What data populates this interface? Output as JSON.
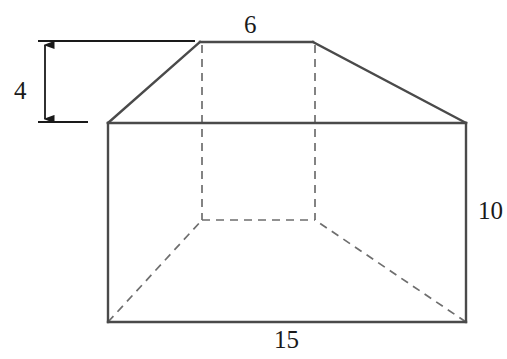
{
  "figure": {
    "kind": "solid-geometry-diagram",
    "colors": {
      "background": "#ffffff",
      "visible_edge": "#4a4a4a",
      "hidden_edge": "#6e6e6e",
      "dimension_line": "#1a1a1a",
      "label_text": "#1a1a1a"
    },
    "stroke": {
      "visible_width": 2.4,
      "hidden_width": 1.7,
      "hidden_dash": "8 6",
      "dimension_width": 1.8
    }
  },
  "labels": {
    "top_width": "6",
    "bottom_width": "15",
    "right_height": "10",
    "left_height": "4"
  },
  "geometry": {
    "front_face": {
      "top_left": [
        108,
        123
      ],
      "top_right": [
        466,
        123
      ],
      "bottom_right": [
        466,
        322
      ],
      "bottom_left": [
        108,
        322
      ]
    },
    "roof_ridge": {
      "left": [
        200,
        42
      ],
      "right": [
        313,
        42
      ]
    },
    "slant_left": [
      [
        108,
        123
      ],
      [
        200,
        42
      ]
    ],
    "slant_right": [
      [
        313,
        42
      ],
      [
        466,
        123
      ]
    ],
    "hidden_edges": {
      "back_vertical_left": [
        [
          202,
          45
        ],
        [
          202,
          220
        ]
      ],
      "back_vertical_right": [
        [
          315,
          45
        ],
        [
          315,
          220
        ]
      ],
      "back_bottom": [
        [
          202,
          220
        ],
        [
          315,
          220
        ]
      ],
      "diagonal_left": [
        [
          108,
          322
        ],
        [
          202,
          220
        ]
      ],
      "diagonal_right": [
        [
          466,
          322
        ],
        [
          315,
          220
        ]
      ]
    },
    "dimension_4": {
      "arrow_x": 45,
      "arrow_top_y": 45,
      "arrow_bottom_y": 119,
      "extension_top": [
        [
          38,
          41
        ],
        [
          195,
          41
        ]
      ],
      "extension_bottom": [
        [
          38,
          122
        ],
        [
          88,
          122
        ]
      ]
    }
  }
}
